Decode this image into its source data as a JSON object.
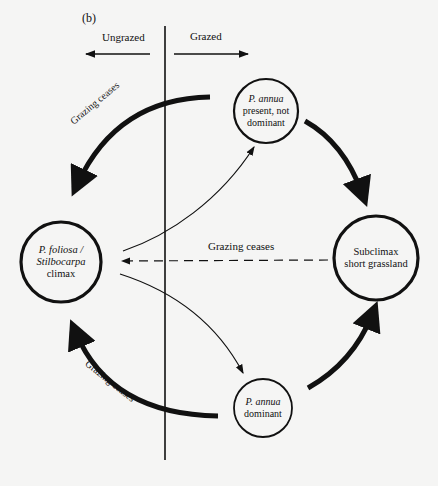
{
  "figure": {
    "panel_label": "(b)",
    "regions": {
      "left": "Ungrazed",
      "right": "Grazed"
    },
    "nodes": {
      "climax": {
        "line1": "P. foliosa /",
        "line2": "Stilbocarpa",
        "line3": "climax"
      },
      "annua_present": {
        "line1": "P. annua",
        "line2": "present, not",
        "line3": "dominant"
      },
      "subclimax": {
        "line1": "Subclimax",
        "line2": "short grassland"
      },
      "annua_dominant": {
        "line1": "P. annua",
        "line2": "dominant"
      }
    },
    "edges": {
      "top_grazing_ceases": "Grazing ceases",
      "middle_grazing_ceases": "Grazing ceases",
      "bottom_grazing_ceases": "Grazing ceases"
    }
  }
}
